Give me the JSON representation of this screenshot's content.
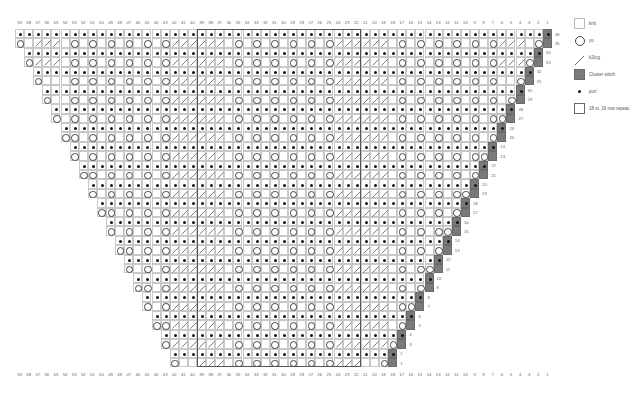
{
  "chart_data": {
    "type": "table",
    "columns": 59,
    "rows": 36,
    "column_labels_top": [
      59,
      58,
      57,
      56,
      55,
      54,
      53,
      52,
      51,
      50,
      49,
      48,
      47,
      46,
      45,
      44,
      43,
      42,
      41,
      40,
      39,
      38,
      37,
      36,
      35,
      34,
      33,
      32,
      31,
      30,
      29,
      28,
      27,
      26,
      25,
      24,
      23,
      22,
      21,
      20,
      19,
      18,
      17,
      16,
      15,
      14,
      13,
      12,
      11,
      10,
      9,
      8,
      7,
      6,
      5,
      4,
      3,
      2,
      1
    ],
    "column_labels_bottom": [
      59,
      58,
      57,
      56,
      55,
      54,
      53,
      52,
      51,
      50,
      49,
      48,
      47,
      46,
      45,
      44,
      43,
      42,
      41,
      40,
      39,
      38,
      37,
      36,
      35,
      34,
      33,
      32,
      31,
      30,
      29,
      28,
      27,
      26,
      25,
      24,
      23,
      22,
      21,
      20,
      19,
      18,
      17,
      16,
      15,
      14,
      13,
      12,
      11,
      10,
      9,
      8,
      7,
      6,
      5,
      4,
      3,
      2,
      1
    ],
    "row_labels": [
      36,
      35,
      34,
      33,
      32,
      31,
      30,
      29,
      28,
      27,
      26,
      25,
      24,
      23,
      22,
      21,
      20,
      19,
      18,
      17,
      16,
      15,
      14,
      13,
      12,
      11,
      10,
      9,
      8,
      7,
      6,
      5,
      4,
      3,
      2,
      1
    ],
    "repeat": {
      "from_col": 39,
      "to_col": 22,
      "stitches": 18,
      "rows": 16,
      "label": "18 st. 16 row repeat."
    },
    "repeat_motif_cols_39_to_22": "///kokokokokoko///",
    "symbol_key": {
      "k": "knit",
      "p": "purl",
      "o": "yo",
      "/": "k2tog",
      "c": "Cluster stitch",
      "C": "Cluster stitch (purl row)",
      ".": "no stitch"
    },
    "row_structure": "Each row pair shifts one column right going down. Rows 36/35 span cols 59-1; rows 2/1 span cols 42-18. Even rows: purl across, cluster at right edge. Odd rows: yo at left edge, lace motif, yo before cluster at right edge."
  },
  "legend": {
    "items": [
      {
        "key": "knit",
        "label": "knit"
      },
      {
        "key": "yo",
        "label": "yo"
      },
      {
        "key": "k2tog",
        "label": "k2tog"
      },
      {
        "key": "cluster",
        "label": "Cluster stitch"
      },
      {
        "key": "purl",
        "label": "purl"
      },
      {
        "key": "repeat",
        "label": "18 st. 16 row repeat."
      }
    ]
  },
  "colors": {
    "cluster": "#7a7a7a",
    "grid": "#c8c8c8",
    "repeat_border": "#555555"
  }
}
